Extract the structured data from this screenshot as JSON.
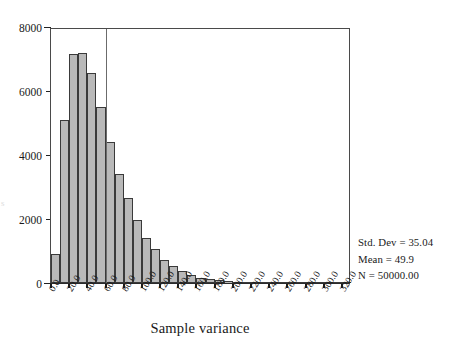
{
  "chart_data": {
    "type": "bar",
    "title": "",
    "subtitle": "",
    "xlabel": "Sample variance",
    "ylabel": "",
    "xlim": [
      0,
      330
    ],
    "ylim": [
      0,
      8000
    ],
    "bin_width": 10,
    "grid": false,
    "legend": null,
    "y_ticks": [
      0,
      2000,
      4000,
      6000,
      8000
    ],
    "y_tick_labels": [
      "0",
      "2000",
      "4000",
      "6000",
      "8000"
    ],
    "x_ticks": [
      0,
      20,
      40,
      60,
      80,
      100,
      120,
      140,
      160,
      180,
      200,
      220,
      240,
      260,
      280,
      300,
      320
    ],
    "x_tick_labels": [
      "0.0",
      "20.0",
      "40.0",
      "60.0",
      "80.0",
      "100.0",
      "120.0",
      "140.0",
      "160.0",
      "180.0",
      "200.0",
      "220.0",
      "240.0",
      "260.0",
      "280.0",
      "300.0",
      "320.0"
    ],
    "bin_starts": [
      0,
      10,
      20,
      30,
      40,
      50,
      60,
      70,
      80,
      90,
      100,
      110,
      120,
      130,
      140,
      150,
      160,
      170,
      180,
      190,
      200,
      210,
      220,
      230,
      240,
      250,
      260,
      270,
      280,
      290,
      300,
      310,
      320
    ],
    "categories": [
      "0-10",
      "10-20",
      "20-30",
      "30-40",
      "40-50",
      "50-60",
      "60-70",
      "70-80",
      "80-90",
      "90-100",
      "100-110",
      "110-120",
      "120-130",
      "130-140",
      "140-150",
      "150-160",
      "160-170",
      "170-180",
      "180-190",
      "190-200",
      "200-210",
      "210-220",
      "220-230",
      "230-240",
      "240-250",
      "250-260",
      "260-270",
      "270-280",
      "280-290",
      "290-300",
      "300-310",
      "310-320",
      "320-330"
    ],
    "values": [
      900,
      5100,
      7150,
      7200,
      6550,
      5500,
      4400,
      3400,
      2650,
      1980,
      1400,
      1050,
      720,
      520,
      380,
      250,
      170,
      120,
      80,
      55,
      35,
      25,
      18,
      12,
      9,
      7,
      5,
      4,
      3,
      2,
      2,
      1,
      1
    ],
    "annotations": [
      {
        "type": "vline",
        "x": 60,
        "label": ""
      }
    ]
  },
  "stats": {
    "std_dev": "Std. Dev = 35.04",
    "mean": "Mean = 49.9",
    "n": "N = 50000.00"
  },
  "colors": {
    "bar_fill": "#b9b9b9",
    "bar_stroke": "#3a3a3a",
    "axis": "#2b2b2b",
    "reference_line": "#6b6b6b",
    "background": "#ffffff"
  }
}
